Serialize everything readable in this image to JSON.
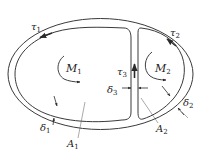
{
  "diagram": {
    "colors": {
      "stroke": "#3a3a3a",
      "background": "#ffffff",
      "text": "#222222"
    },
    "labels": {
      "tau1": {
        "sym": "τ",
        "sub": "1"
      },
      "tau2": {
        "sym": "τ",
        "sub": "2"
      },
      "tau3": {
        "sym": "τ",
        "sub": "3"
      },
      "M1": {
        "sym": "M",
        "sub": "1"
      },
      "M2": {
        "sym": "M",
        "sub": "2"
      },
      "delta1": {
        "sym": "δ",
        "sub": "1"
      },
      "delta2": {
        "sym": "δ",
        "sub": "2"
      },
      "delta3": {
        "sym": "δ",
        "sub": "3"
      },
      "A1": {
        "sym": "A",
        "sub": "1"
      },
      "A2": {
        "sym": "A",
        "sub": "2"
      }
    },
    "cells": [
      {
        "name": "cell-1",
        "moment": "M1",
        "area": "A1",
        "wall_shear": "tau1",
        "wall_thickness": "delta1"
      },
      {
        "name": "cell-2",
        "moment": "M2",
        "area": "A2",
        "wall_shear": "tau2",
        "wall_thickness": "delta2"
      }
    ],
    "web": {
      "shear": "tau3",
      "thickness": "delta3"
    }
  }
}
